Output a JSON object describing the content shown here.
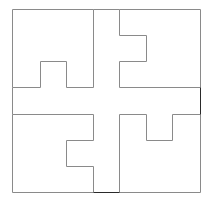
{
  "diagram": {
    "width": 209,
    "height": 206,
    "background": "#ffffff",
    "stroke_color": "#8a8a8a",
    "dark_stroke_color": "#2a2a2a",
    "stroke_width": 1,
    "outer_square": {
      "x1": 12,
      "y1": 9,
      "x2": 200,
      "y2": 192
    },
    "central_cross": {
      "vertical_strip": {
        "x1": 93,
        "x2": 119
      },
      "horizontal_strip": {
        "y1": 87,
        "y2": 114
      }
    },
    "pieces": [
      {
        "name": "top-left-piece",
        "points": [
          [
            12,
            9
          ],
          [
            93,
            9
          ],
          [
            93,
            87
          ],
          [
            66,
            87
          ],
          [
            66,
            61
          ],
          [
            40,
            61
          ],
          [
            40,
            87
          ],
          [
            12,
            87
          ]
        ]
      },
      {
        "name": "top-right-piece",
        "points": [
          [
            119,
            9
          ],
          [
            200,
            9
          ],
          [
            200,
            87
          ],
          [
            119,
            87
          ],
          [
            119,
            61
          ],
          [
            146,
            61
          ],
          [
            146,
            35
          ],
          [
            119,
            35
          ]
        ]
      },
      {
        "name": "bottom-left-piece",
        "points": [
          [
            12,
            114
          ],
          [
            93,
            114
          ],
          [
            93,
            140
          ],
          [
            66,
            140
          ],
          [
            66,
            166
          ],
          [
            93,
            166
          ],
          [
            93,
            192
          ],
          [
            12,
            192
          ]
        ]
      },
      {
        "name": "bottom-right-piece",
        "points": [
          [
            119,
            114
          ],
          [
            146,
            114
          ],
          [
            146,
            140
          ],
          [
            172,
            140
          ],
          [
            172,
            114
          ],
          [
            200,
            114
          ],
          [
            200,
            192
          ],
          [
            119,
            192
          ]
        ]
      }
    ],
    "dark_segments": [
      {
        "name": "bottom-cross-edge",
        "x1": 93,
        "y1": 192,
        "x2": 119,
        "y2": 192
      },
      {
        "name": "right-cross-edge",
        "x1": 200,
        "y1": 87,
        "x2": 200,
        "y2": 114
      }
    ]
  }
}
